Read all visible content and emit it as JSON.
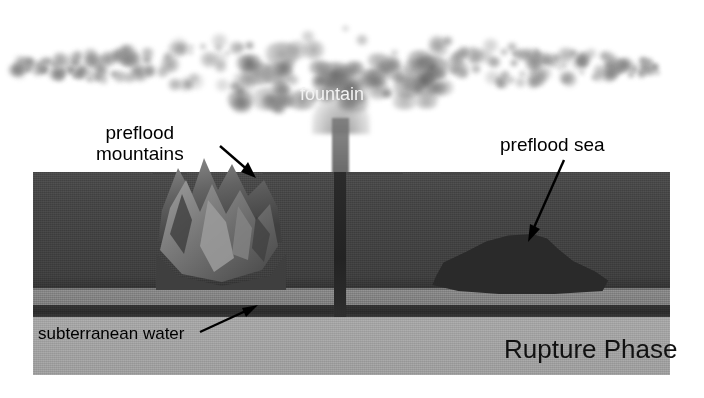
{
  "figure": {
    "title": "Rupture Phase",
    "type": "geological cross-section illustration"
  },
  "labels": {
    "fountain": "fountain",
    "preflood_mountains": "preflood\nmountains",
    "preflood_mountains_line1": "preflood",
    "preflood_mountains_line2": "mountains",
    "preflood_sea": "preflood sea",
    "subterranean_water": "subterranean water",
    "phase_title": "Rupture Phase"
  },
  "annotations": [
    {
      "name": "mountains-arrow",
      "from": "preflood mountains label",
      "to": "mountain peaks",
      "direction": "down-right"
    },
    {
      "name": "sea-arrow",
      "from": "preflood sea label",
      "to": "dark sea body",
      "direction": "down-left"
    },
    {
      "name": "water-arrow",
      "from": "subterranean water label",
      "to": "dark water band",
      "direction": "up-right"
    }
  ],
  "layers": [
    {
      "name": "crust",
      "label": "",
      "color": "#474747"
    },
    {
      "name": "sediment",
      "label": "",
      "color": "#838383"
    },
    {
      "name": "subterranean-water",
      "label": "subterranean water",
      "color": "#2f2f2f"
    },
    {
      "name": "basement",
      "label": "",
      "color": "#a2a2a2"
    }
  ],
  "features": [
    {
      "name": "fountain-plume",
      "label": "fountain",
      "color": "#8c8c8c"
    },
    {
      "name": "preflood-mountains",
      "label": "preflood mountains",
      "color": "#6e6e6e"
    },
    {
      "name": "preflood-sea",
      "label": "preflood sea",
      "color": "#2a2a2a"
    },
    {
      "name": "rupture-rift",
      "label": "",
      "color": "#272727"
    }
  ],
  "colors": {
    "background": "#ffffff",
    "crust": "#474747",
    "sediment": "#838383",
    "water_band": "#2f2f2f",
    "basement": "#a2a2a2",
    "sea": "#2a2a2a",
    "plume": "#8c8c8c",
    "label_text": "#000000",
    "fountain_text": "#f2f2f2"
  }
}
